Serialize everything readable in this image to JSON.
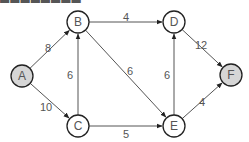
{
  "graph": {
    "directed": true,
    "colors": {
      "edge": "#555555",
      "node_stroke": "#222222",
      "node_fill": "#ffffff",
      "terminal_fill": "#d6d6d6",
      "label": "#555555"
    },
    "nodes": [
      {
        "id": "A",
        "label": "A",
        "x": 22,
        "y": 76,
        "terminal": true
      },
      {
        "id": "B",
        "label": "B",
        "x": 78,
        "y": 22,
        "terminal": false
      },
      {
        "id": "C",
        "label": "C",
        "x": 78,
        "y": 126,
        "terminal": false
      },
      {
        "id": "D",
        "label": "D",
        "x": 174,
        "y": 22,
        "terminal": false
      },
      {
        "id": "E",
        "label": "E",
        "x": 174,
        "y": 126,
        "terminal": false
      },
      {
        "id": "F",
        "label": "F",
        "x": 231,
        "y": 75,
        "terminal": true
      }
    ],
    "edges": [
      {
        "from": "A",
        "to": "B",
        "weight": "8",
        "label_x": 48,
        "label_y": 52
      },
      {
        "from": "A",
        "to": "C",
        "weight": "10",
        "label_x": 46,
        "label_y": 111
      },
      {
        "from": "C",
        "to": "B",
        "weight": "6",
        "label_x": 70,
        "label_y": 79
      },
      {
        "from": "B",
        "to": "D",
        "weight": "4",
        "label_x": 126,
        "label_y": 21
      },
      {
        "from": "B",
        "to": "E",
        "weight": "6",
        "label_x": 130,
        "label_y": 75
      },
      {
        "from": "C",
        "to": "E",
        "weight": "5",
        "label_x": 126,
        "label_y": 138
      },
      {
        "from": "E",
        "to": "D",
        "weight": "6",
        "label_x": 167,
        "label_y": 79
      },
      {
        "from": "D",
        "to": "F",
        "weight": "12",
        "label_x": 201,
        "label_y": 49
      },
      {
        "from": "E",
        "to": "F",
        "weight": "4",
        "label_x": 202,
        "label_y": 106
      }
    ]
  }
}
